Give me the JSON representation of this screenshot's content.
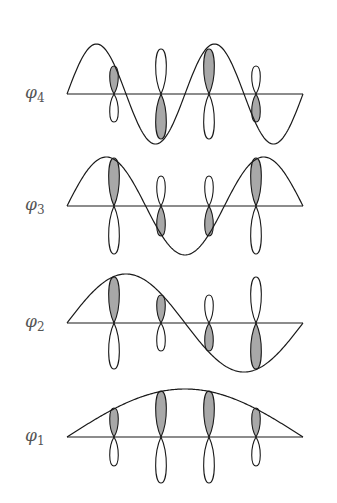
{
  "figure": {
    "colors": {
      "line": "#1a1a1a",
      "shade": "#a8a8a8",
      "label": "#555555"
    },
    "axis": {
      "x_start": 67,
      "x_end": 303
    },
    "atoms_x": [
      114,
      161,
      209,
      256
    ],
    "orbitals": [
      {
        "label": "φ",
        "sub": "4",
        "n": 4,
        "axis_y": 94,
        "amp": 50,
        "lobes": [
          {
            "size": 28
          },
          {
            "size": 45
          },
          {
            "size": 45
          },
          {
            "size": 28
          }
        ]
      },
      {
        "label": "φ",
        "sub": "3",
        "n": 3,
        "axis_y": 206,
        "amp": 49,
        "lobes": [
          {
            "size": 48
          },
          {
            "size": 30
          },
          {
            "size": 30
          },
          {
            "size": 48
          }
        ]
      },
      {
        "label": "φ",
        "sub": "2",
        "n": 2,
        "axis_y": 323,
        "amp": 49,
        "lobes": [
          {
            "size": 46
          },
          {
            "size": 28
          },
          {
            "size": 28
          },
          {
            "size": 46
          }
        ]
      },
      {
        "label": "φ",
        "sub": "1",
        "n": 1,
        "axis_y": 437,
        "amp": 48,
        "lobes": [
          {
            "size": 29
          },
          {
            "size": 46
          },
          {
            "size": 46
          },
          {
            "size": 29
          }
        ]
      }
    ]
  }
}
